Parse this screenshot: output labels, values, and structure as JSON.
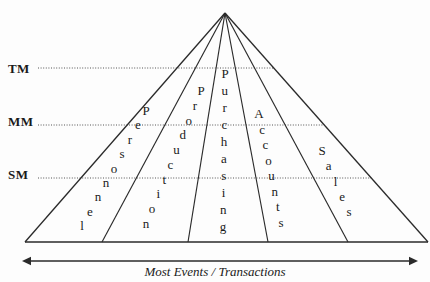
{
  "diagram": {
    "type": "organizational-pyramid",
    "title_caption": "Most Events / Transactions",
    "colors": {
      "background": "#fdfdfd",
      "stroke": "#2a2a2a",
      "text": "#1a1a1a",
      "dotted": "#555555"
    },
    "tiers": [
      {
        "id": "tm",
        "label": "TM",
        "y": 68
      },
      {
        "id": "mm",
        "label": "MM",
        "y": 125
      },
      {
        "id": "sm",
        "label": "SM",
        "y": 178
      }
    ],
    "departments": [
      {
        "id": "personnel",
        "label": "Personnel",
        "letters": [
          "P",
          "e",
          "r",
          "s",
          "o",
          "n",
          "n",
          "e",
          "l"
        ],
        "start": {
          "x": 146,
          "y": 110
        },
        "end": {
          "x": 82,
          "y": 225
        }
      },
      {
        "id": "production",
        "label": "Production",
        "letters": [
          "P",
          "r",
          "o",
          "d",
          "u",
          "c",
          "t",
          "i",
          "o",
          "n"
        ],
        "start": {
          "x": 201,
          "y": 90
        },
        "end": {
          "x": 146,
          "y": 223
        }
      },
      {
        "id": "purchasing",
        "label": "Purchasing",
        "letters": [
          "P",
          "u",
          "r",
          "c",
          "h",
          "a",
          "s",
          "i",
          "n",
          "g"
        ],
        "start": {
          "x": 225,
          "y": 73
        },
        "end": {
          "x": 223,
          "y": 226
        }
      },
      {
        "id": "accounts",
        "label": "Accounts",
        "letters": [
          "A",
          "c",
          "c",
          "o",
          "u",
          "n",
          "t",
          "s"
        ],
        "start": {
          "x": 259,
          "y": 113
        },
        "end": {
          "x": 281,
          "y": 222
        }
      },
      {
        "id": "sales",
        "label": "Sales",
        "letters": [
          "S",
          "a",
          "l",
          "e",
          "s"
        ],
        "start": {
          "x": 322,
          "y": 150
        },
        "end": {
          "x": 349,
          "y": 211
        }
      }
    ],
    "pyramid": {
      "apex": {
        "x": 225,
        "y": 13
      },
      "base_y": 242,
      "base_left_x": 25,
      "base_right_x": 428,
      "divider_base_x": [
        102,
        188,
        268,
        348
      ]
    },
    "arrow": {
      "y": 261,
      "x_start": 22,
      "x_end": 418,
      "label": "Most Events / Transactions"
    }
  }
}
